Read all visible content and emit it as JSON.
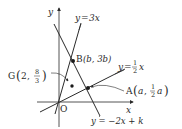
{
  "diagram": {
    "axes": {
      "x_label": "x",
      "y_label": "y",
      "origin_label": "O"
    },
    "lines": [
      {
        "id": "line-3x",
        "equation": "y=3x",
        "label_lhs": "y",
        "label_eq": "=",
        "label_rhs": "3x",
        "slope": 3,
        "intercept": 0
      },
      {
        "id": "line-half-x",
        "equation": "y=1/2x",
        "label_lhs": "y",
        "label_eq": "=",
        "label_num": "1",
        "label_den": "2",
        "label_var": "x",
        "slope": 0.5,
        "intercept": 0
      },
      {
        "id": "line-neg2x-k",
        "equation": "y=-2x+k",
        "label_text": "y = −2x + k",
        "slope": -2,
        "intercept_symbol": "k"
      }
    ],
    "points": {
      "B": {
        "name": "B",
        "coord_text": "(b, 3b)",
        "x_expr": "b",
        "y_expr": "3b"
      },
      "A": {
        "name": "A",
        "x_expr": "a",
        "y_num": "1",
        "y_den": "2",
        "y_var": "a"
      },
      "G": {
        "name": "G",
        "x_value": "2",
        "y_num": "8",
        "y_den": "3"
      }
    },
    "colors": {
      "stroke": "#2a2a2a",
      "background": "#ffffff"
    }
  }
}
